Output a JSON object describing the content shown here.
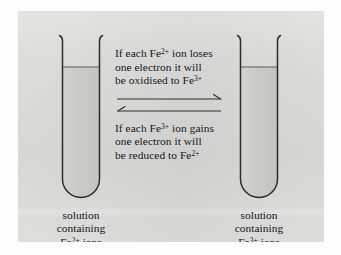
{
  "figure": {
    "panel_color": "#d7d7d5",
    "ink_color": "#16161a",
    "liquid_color": "#c9c9c7"
  },
  "tubes": [
    {
      "id": "left",
      "name": "test-tube-left",
      "caption": {
        "line1": "solution",
        "line2": "containing",
        "line3_prefix": "Fe",
        "line3_charge": "2+",
        "line3_suffix": " ions"
      }
    },
    {
      "id": "right",
      "name": "test-tube-right",
      "caption": {
        "line1": "solution",
        "line2": "containing",
        "line3_prefix": "Fe",
        "line3_charge": "3+",
        "line3_suffix": " ions"
      }
    }
  ],
  "reaction": {
    "forward": {
      "label": "oxidation-statement",
      "line1_prefix": "If each Fe",
      "line1_charge": "2+",
      "line1_suffix": " ion loses",
      "line2": "one electron it will",
      "line3_prefix": "be oxidised to Fe",
      "line3_charge": "3+",
      "line3_suffix": ""
    },
    "reverse": {
      "label": "reduction-statement",
      "line1_prefix": "If each Fe",
      "line1_charge": "3+",
      "line1_suffix": " ion gains",
      "line2": "one electron it will",
      "line3_prefix": "be reduced to Fe",
      "line3_charge": "2+",
      "line3_suffix": ""
    },
    "arrows": {
      "forward_direction": "right",
      "reverse_direction": "left"
    }
  }
}
